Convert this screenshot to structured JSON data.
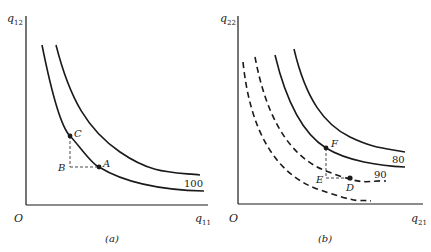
{
  "figure": {
    "panels": [
      {
        "id": "a",
        "caption": "(a)",
        "origin_label": "O",
        "y_axis_label": "q",
        "y_axis_sub": "12",
        "x_axis_label": "q",
        "x_axis_sub": "11",
        "curve_label": "100",
        "points": {
          "A": "A",
          "B": "B",
          "C": "C"
        }
      },
      {
        "id": "b",
        "caption": "(b)",
        "origin_label": "O",
        "y_axis_label": "q",
        "y_axis_sub": "22",
        "x_axis_label": "q",
        "x_axis_sub": "21",
        "curve_label_solid": "80",
        "curve_label_dashed": "90",
        "points": {
          "D": "D",
          "E": "E",
          "F": "F"
        }
      }
    ],
    "colors": {
      "ink": "#1a1a1a",
      "background": "#ffffff"
    }
  }
}
